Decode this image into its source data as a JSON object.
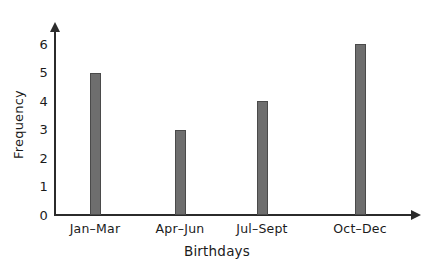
{
  "chart_data": {
    "type": "bar",
    "title": "",
    "subtitle": "",
    "xlabel": "Birthdays",
    "ylabel": "Frequency",
    "categories": [
      "Jan–Mar",
      "Apr–Jun",
      "Jul–Sept",
      "Oct–Dec"
    ],
    "values": [
      5,
      3,
      4,
      6
    ],
    "ylim": [
      0,
      6
    ],
    "ytick_labels": [
      "0",
      "1",
      "2",
      "3",
      "4",
      "5",
      "6"
    ],
    "ytick_values": [
      0,
      1,
      2,
      3,
      4,
      5,
      6
    ],
    "grid": false,
    "legend": false,
    "legend_position": "none",
    "annotations": [],
    "colors": {
      "bar_fill": "#6e6e6e",
      "bar_border": "#4a4a4a",
      "axis": "#2b2b2b",
      "text": "#1b1b1b",
      "background": "#ffffff"
    },
    "axis_style": {
      "y_axis_arrow": true,
      "x_axis_arrow": true,
      "tick_marks": false
    }
  }
}
